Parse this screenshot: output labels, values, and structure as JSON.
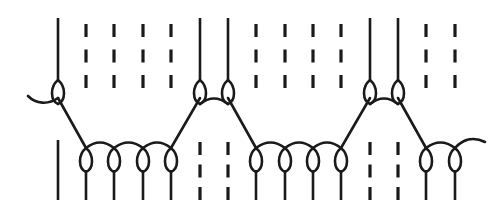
{
  "figure": {
    "width": 499,
    "height": 221,
    "background_color": "#ffffff",
    "stroke_color": "#1a1a1a",
    "stroke_width": 2.6
  },
  "chart_data": {
    "type": "diagram",
    "title": "",
    "xlabel": "",
    "ylabel": "",
    "grid": false,
    "legend": false,
    "columns": 16,
    "column_pitch": 28.4,
    "column_x": [
      58,
      86,
      114,
      143,
      171,
      200,
      228,
      256,
      285,
      313,
      341,
      370,
      398,
      426,
      455,
      483
    ],
    "rows": [
      {
        "name": "upper-course",
        "needle_y": 80,
        "tail_top_y": 18,
        "tail_bottom_y": 0,
        "loops": [
          {
            "index": 0,
            "x": 58
          },
          {
            "index": 5,
            "x": 200
          },
          {
            "index": 6,
            "x": 228
          },
          {
            "index": 11,
            "x": 370
          },
          {
            "index": 12,
            "x": 398
          }
        ],
        "dashes": [
          {
            "index": 1,
            "x": 86
          },
          {
            "index": 2,
            "x": 114
          },
          {
            "index": 3,
            "x": 143
          },
          {
            "index": 4,
            "x": 171
          },
          {
            "index": 7,
            "x": 256
          },
          {
            "index": 8,
            "x": 285
          },
          {
            "index": 9,
            "x": 313
          },
          {
            "index": 10,
            "x": 341
          },
          {
            "index": 13,
            "x": 426
          },
          {
            "index": 14,
            "x": 455
          }
        ]
      },
      {
        "name": "lower-course",
        "needle_y": 148,
        "tail_top_y": 0,
        "tail_bottom_y": 200,
        "loops": [
          {
            "index": 1,
            "x": 86
          },
          {
            "index": 2,
            "x": 114
          },
          {
            "index": 3,
            "x": 143
          },
          {
            "index": 4,
            "x": 171
          },
          {
            "index": 7,
            "x": 256
          },
          {
            "index": 8,
            "x": 285
          },
          {
            "index": 9,
            "x": 313
          },
          {
            "index": 10,
            "x": 341
          },
          {
            "index": 13,
            "x": 426
          },
          {
            "index": 14,
            "x": 455
          }
        ],
        "dashes": [
          {
            "index": 5,
            "x": 200
          },
          {
            "index": 6,
            "x": 228
          },
          {
            "index": 11,
            "x": 370
          },
          {
            "index": 12,
            "x": 398
          }
        ],
        "solids": [
          {
            "index": 0,
            "x": 58
          }
        ]
      }
    ],
    "underlaps": [
      {
        "from_row": "upper",
        "from_x": 58,
        "to_row": "lower",
        "to_x": 86
      },
      {
        "from_row": "lower",
        "from_x": 171,
        "to_row": "upper",
        "to_x": 200
      },
      {
        "from_row": "upper",
        "from_x": 228,
        "to_row": "lower",
        "to_x": 256
      },
      {
        "from_row": "lower",
        "from_x": 341,
        "to_row": "upper",
        "to_x": 370
      },
      {
        "from_row": "upper",
        "from_x": 398,
        "to_row": "lower",
        "to_x": 426
      }
    ],
    "connector_arcs": [
      {
        "row": "lower",
        "from_x": 86,
        "to_x": 114
      },
      {
        "row": "lower",
        "from_x": 114,
        "to_x": 143
      },
      {
        "row": "lower",
        "from_x": 143,
        "to_x": 171
      },
      {
        "row": "upper",
        "from_x": 200,
        "to_x": 228
      },
      {
        "row": "lower",
        "from_x": 256,
        "to_x": 285
      },
      {
        "row": "lower",
        "from_x": 285,
        "to_x": 313
      },
      {
        "row": "lower",
        "from_x": 313,
        "to_x": 341
      },
      {
        "row": "upper",
        "from_x": 370,
        "to_x": 398
      },
      {
        "row": "lower",
        "from_x": 426,
        "to_x": 455
      }
    ],
    "end_tails": [
      {
        "name": "left-tail",
        "anchor_x": 58,
        "anchor_row": "upper",
        "direction": "left"
      },
      {
        "name": "right-tail",
        "anchor_x": 455,
        "anchor_row": "lower",
        "direction": "right"
      }
    ],
    "dash_pattern": {
      "segments": 3,
      "segment_length": 13,
      "gap_length": 12
    }
  }
}
